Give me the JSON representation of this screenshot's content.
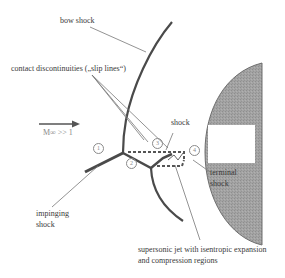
{
  "diagram": {
    "type": "shock interaction schematic",
    "labels": {
      "bow_shock": "bow shock",
      "contact_discontinuities": "contact discontinuities („slip lines“)",
      "mach": "M∞ >> 1",
      "shock": "shock",
      "terminal_shock_line1": "terminal",
      "terminal_shock_line2": "shock",
      "impinging_shock_line1": "impinging",
      "impinging_shock_line2": "shock",
      "supersonic_jet_line1": "supersonic jet with isentropic expansion",
      "supersonic_jet_line2": "and compression regions"
    },
    "markers": [
      "1",
      "2",
      "3",
      "4"
    ],
    "colors": {
      "shock_line": "#4a4a4a",
      "leader_line": "#777777",
      "body_fill": "#9a9a9a",
      "body_edge": "#6e6e6e",
      "background": "#ffffff"
    }
  }
}
